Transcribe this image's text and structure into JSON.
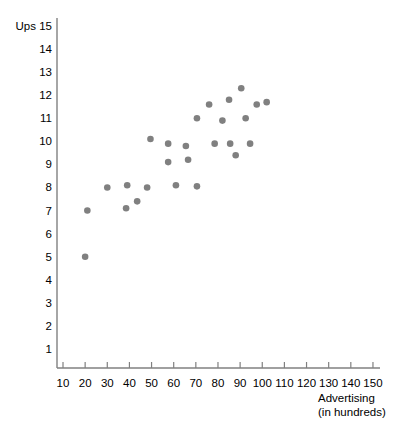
{
  "chart_data": {
    "type": "scatter",
    "title": "",
    "xlabel": "Advertising (in hundreds)",
    "xlabel_line1": "Advertising",
    "xlabel_line2": "(in hundreds)",
    "ylabel": "Ups",
    "xlim": [
      0,
      155
    ],
    "ylim": [
      0,
      15.6
    ],
    "grid": false,
    "legend": null,
    "xticks": [
      10,
      20,
      30,
      40,
      50,
      60,
      70,
      80,
      90,
      100,
      110,
      120,
      130,
      140,
      150
    ],
    "xtick_labels": [
      "10",
      "20",
      "30",
      "40",
      "50",
      "60",
      "70",
      "80",
      "90",
      "100",
      "110",
      "120",
      "130",
      "140",
      "150"
    ],
    "yticks": [
      1,
      2,
      3,
      4,
      5,
      6,
      7,
      8,
      9,
      10,
      11,
      12,
      13,
      14,
      15
    ],
    "ytick_labels": [
      "1",
      "2",
      "3",
      "4",
      "5",
      "6",
      "7",
      "8",
      "9",
      "10",
      "11",
      "12",
      "13",
      "14",
      "15"
    ],
    "point_color": "#808080",
    "point_radius": 3.3,
    "axis_color": "#808080",
    "series": [
      {
        "name": "observations",
        "points": [
          {
            "x": 20,
            "y": 5
          },
          {
            "x": 21,
            "y": 7
          },
          {
            "x": 30,
            "y": 8
          },
          {
            "x": 39,
            "y": 8.1
          },
          {
            "x": 38.5,
            "y": 7.1
          },
          {
            "x": 43.5,
            "y": 7.4
          },
          {
            "x": 48,
            "y": 8
          },
          {
            "x": 49.5,
            "y": 10.1
          },
          {
            "x": 57.5,
            "y": 9.9
          },
          {
            "x": 57.5,
            "y": 9.1
          },
          {
            "x": 61,
            "y": 8.1
          },
          {
            "x": 65.5,
            "y": 9.8
          },
          {
            "x": 66.5,
            "y": 9.2
          },
          {
            "x": 70.5,
            "y": 8.05
          },
          {
            "x": 70.5,
            "y": 11
          },
          {
            "x": 76,
            "y": 11.6
          },
          {
            "x": 78.5,
            "y": 9.9
          },
          {
            "x": 82,
            "y": 10.9
          },
          {
            "x": 85,
            "y": 11.8
          },
          {
            "x": 85.5,
            "y": 9.9
          },
          {
            "x": 90.5,
            "y": 12.3
          },
          {
            "x": 88,
            "y": 9.4
          },
          {
            "x": 92.5,
            "y": 11
          },
          {
            "x": 97.5,
            "y": 11.6
          },
          {
            "x": 94.5,
            "y": 9.9
          },
          {
            "x": 102,
            "y": 11.7
          }
        ]
      }
    ]
  },
  "labels": {
    "y_axis_title": "Ups",
    "x_axis_title_line1": "Advertising",
    "x_axis_title_line2": "(in hundreds)"
  }
}
